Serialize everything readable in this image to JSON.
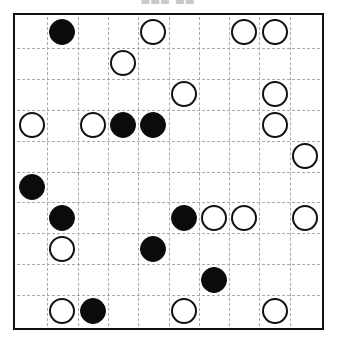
{
  "caption": {
    "text": "███ ██",
    "note": "clipped-text-top-edge"
  },
  "board": {
    "name": "go-style-stone-grid",
    "columns": 10,
    "rows": 10,
    "cell_size_px": 31,
    "border_color": "#111111",
    "gridline_color": "#a9a9a9",
    "gridline_style": "dashed",
    "background_color": "#ffffff",
    "black_stone_color": "#0b0b0b",
    "white_stone_color": "#ffffff",
    "white_stone_outline": "#111111",
    "stones": [
      {
        "row": 0,
        "col": 1,
        "color": "black"
      },
      {
        "row": 0,
        "col": 4,
        "color": "white"
      },
      {
        "row": 0,
        "col": 7,
        "color": "white"
      },
      {
        "row": 0,
        "col": 8,
        "color": "white"
      },
      {
        "row": 1,
        "col": 3,
        "color": "white"
      },
      {
        "row": 2,
        "col": 5,
        "color": "white"
      },
      {
        "row": 2,
        "col": 8,
        "color": "white"
      },
      {
        "row": 3,
        "col": 0,
        "color": "white"
      },
      {
        "row": 3,
        "col": 2,
        "color": "white"
      },
      {
        "row": 3,
        "col": 3,
        "color": "black"
      },
      {
        "row": 3,
        "col": 4,
        "color": "black"
      },
      {
        "row": 3,
        "col": 8,
        "color": "white"
      },
      {
        "row": 4,
        "col": 9,
        "color": "white"
      },
      {
        "row": 5,
        "col": 0,
        "color": "black"
      },
      {
        "row": 6,
        "col": 1,
        "color": "black"
      },
      {
        "row": 6,
        "col": 5,
        "color": "black"
      },
      {
        "row": 6,
        "col": 6,
        "color": "white"
      },
      {
        "row": 6,
        "col": 7,
        "color": "white"
      },
      {
        "row": 6,
        "col": 9,
        "color": "white"
      },
      {
        "row": 7,
        "col": 1,
        "color": "white"
      },
      {
        "row": 7,
        "col": 4,
        "color": "black"
      },
      {
        "row": 8,
        "col": 6,
        "color": "black"
      },
      {
        "row": 9,
        "col": 1,
        "color": "white"
      },
      {
        "row": 9,
        "col": 2,
        "color": "black"
      },
      {
        "row": 9,
        "col": 5,
        "color": "white"
      },
      {
        "row": 9,
        "col": 8,
        "color": "white"
      }
    ]
  }
}
